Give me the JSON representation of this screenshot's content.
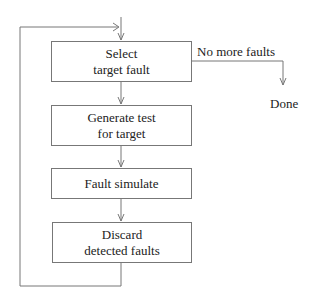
{
  "diagram": {
    "type": "flowchart",
    "title": "",
    "nodes": [
      {
        "id": "select",
        "lines": [
          "Select",
          "target fault"
        ]
      },
      {
        "id": "generate",
        "lines": [
          "Generate test",
          "for target"
        ]
      },
      {
        "id": "simulate",
        "lines": [
          "Fault simulate"
        ]
      },
      {
        "id": "discard",
        "lines": [
          "Discard",
          "detected faults"
        ]
      }
    ],
    "exit_label": "No more faults",
    "terminal": "Done",
    "edges": [
      {
        "from": "select",
        "to": "generate"
      },
      {
        "from": "generate",
        "to": "simulate"
      },
      {
        "from": "simulate",
        "to": "discard"
      },
      {
        "from": "discard",
        "to": "select",
        "type": "loop-back"
      },
      {
        "from": "select",
        "to": "Done",
        "label": "No more faults"
      }
    ],
    "colors": {
      "line": "#777777",
      "text": "#222222",
      "background": "#ffffff"
    }
  }
}
